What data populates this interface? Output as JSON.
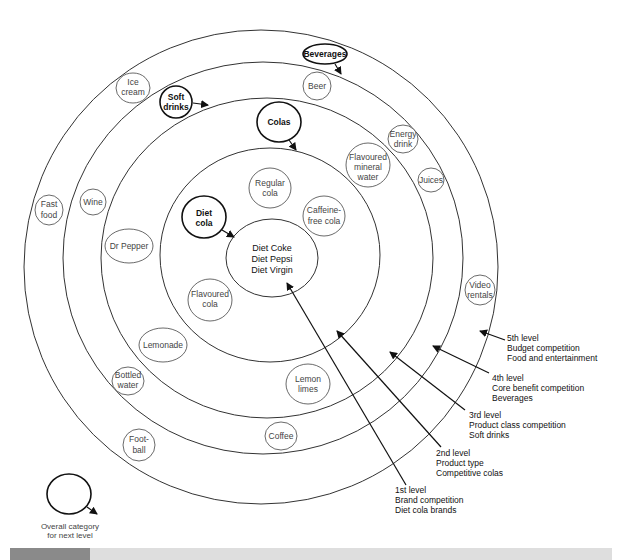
{
  "diagram": {
    "center": {
      "lines": [
        "Diet Coke",
        "Diet Pepsi",
        "Diet Virgin"
      ]
    },
    "rings": [
      {
        "level": 2,
        "cx": 270,
        "cy": 255,
        "rx": 110,
        "ry": 107
      },
      {
        "level": 3,
        "cx": 267,
        "cy": 258,
        "rx": 166,
        "ry": 160
      },
      {
        "level": 4,
        "cx": 263,
        "cy": 258,
        "rx": 200,
        "ry": 196
      },
      {
        "level": 5,
        "cx": 261,
        "cy": 267,
        "rx": 237,
        "ry": 237
      }
    ],
    "categories": {
      "diet_cola": [
        "Diet",
        "cola"
      ],
      "colas": "Colas",
      "soft_drinks": [
        "Soft",
        "drinks"
      ],
      "beverages": "Beverages"
    },
    "ring2_items": {
      "regular_cola": [
        "Regular",
        "cola"
      ],
      "caffeine_free": [
        "Caffeine-",
        "free cola"
      ],
      "flavoured_cola": [
        "Flavoured",
        "cola"
      ]
    },
    "ring3_items": {
      "flavoured_mineral_water": [
        "Flavoured",
        "mineral",
        "water"
      ],
      "dr_pepper": "Dr Pepper",
      "lemonade": "Lemonade",
      "lemon_limes": [
        "Lemon",
        "limes"
      ]
    },
    "ring4_items": {
      "beer": "Beer",
      "energy_drink": [
        "Energy",
        "drink"
      ],
      "juices": "Juices",
      "wine": "Wine",
      "bottled_water": [
        "Bottled",
        "water"
      ],
      "coffee": "Coffee"
    },
    "ring5_items": {
      "ice_cream": [
        "Ice",
        "cream"
      ],
      "fast_food": [
        "Fast",
        "food"
      ],
      "video_rentals": [
        "Video",
        "rentals"
      ],
      "football": [
        "Foot-",
        "ball"
      ]
    },
    "levels": [
      {
        "name": "1st level",
        "desc": "Brand competition",
        "example": "Diet cola brands"
      },
      {
        "name": "2nd level",
        "desc": "Product type",
        "example": "Competitive colas"
      },
      {
        "name": "3rd level",
        "desc": "Product class competition",
        "example": "Soft drinks"
      },
      {
        "name": "4th level",
        "desc": "Core benefit competition",
        "example": "Beverages"
      },
      {
        "name": "5th level",
        "desc": "Budget competition",
        "example": "Food and entertainment"
      }
    ],
    "legend": {
      "lines": [
        "Overall category",
        "for next level"
      ]
    }
  },
  "colors": {
    "line": "#333333",
    "bold_line": "#111111",
    "bar_dark": "#8a8a8a",
    "bar_light": "#dedede"
  }
}
